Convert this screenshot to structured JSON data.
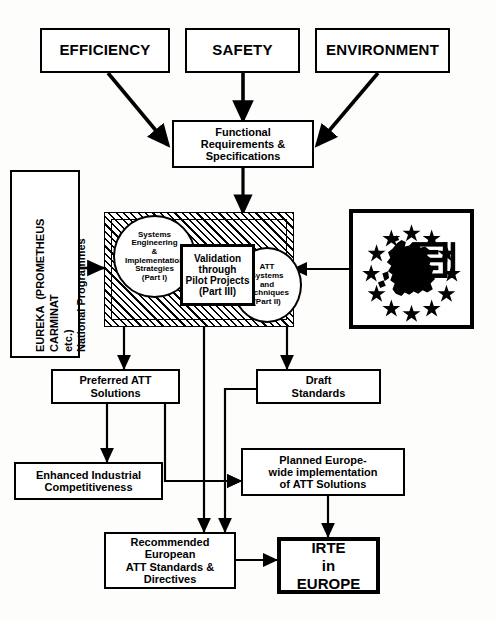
{
  "diagram": {
    "type": "flow-diagram",
    "background_color": "#fdfdfc",
    "line_color": "#000000",
    "nodes": [
      {
        "id": "efficiency",
        "label": "EFFICIENCY",
        "shape": "rect"
      },
      {
        "id": "safety",
        "label": "SAFETY",
        "shape": "rect"
      },
      {
        "id": "environment",
        "label": "ENVIRONMENT",
        "shape": "rect"
      },
      {
        "id": "functional",
        "label": "Functional\nRequirements &\nSpecifications",
        "shape": "rect"
      },
      {
        "id": "eureka",
        "label": "EUREKA  (PROMETHEUS\nCARMINAT\netc.)",
        "label2": "National Programmes",
        "shape": "rect-vertical"
      },
      {
        "id": "systems",
        "label": "Systems\nEngineering\n&\nImplementation\nStrategies\n(Part I)",
        "shape": "circle"
      },
      {
        "id": "validation",
        "label": "Validation\nthrough\nPilot Projects\n(Part III)",
        "shape": "rect"
      },
      {
        "id": "att",
        "label": "ATT\nSystems\nand\nTechniques\n(Part II)",
        "shape": "circle"
      },
      {
        "id": "eu-logo",
        "label": "",
        "shape": "image",
        "icon": "europe-stars-icon"
      },
      {
        "id": "preferred",
        "label": "Preferred ATT\nSolutions",
        "shape": "rect"
      },
      {
        "id": "draft",
        "label": "Draft\nStandards",
        "shape": "rect"
      },
      {
        "id": "enhanced",
        "label": "Enhanced Industrial\nCompetitiveness",
        "shape": "rect"
      },
      {
        "id": "planned",
        "label": "Planned Europe-\nwide implementation\nof ATT Solutions",
        "shape": "rect"
      },
      {
        "id": "recommended",
        "label": "Recommended\nEuropean\nATT Standards &\nDirectives",
        "shape": "rect"
      },
      {
        "id": "irte",
        "label": "IRTE\nin\nEUROPE",
        "shape": "rect"
      }
    ]
  },
  "labels": {
    "efficiency": "EFFICIENCY",
    "safety": "SAFETY",
    "environment": "ENVIRONMENT",
    "functional": "Functional\nRequirements &\nSpecifications",
    "eureka_line1": "EUREKA  (PROMETHEUS",
    "eureka_line2": "CARMINAT",
    "eureka_line3": "etc.)",
    "eureka_line4": "National Programmes",
    "systems": "Systems\nEngineering\n&\nImplementation\nStrategies\n(Part I)",
    "validation": "Validation\nthrough\nPilot Projects\n(Part III)",
    "att": "ATT\nSystems\nand\nTechniques\n(Part II)",
    "preferred": "Preferred ATT\nSolutions",
    "draft": "Draft\nStandards",
    "enhanced": "Enhanced Industrial\nCompetitiveness",
    "planned": "Planned Europe-\nwide implementation\nof ATT Solutions",
    "recommended": "Recommended\nEuropean\nATT Standards &\nDirectives",
    "irte": "IRTE\nin\nEUROPE"
  },
  "icons": {
    "eu_logo": "europe-stars-icon",
    "eu_star_count": 12
  }
}
